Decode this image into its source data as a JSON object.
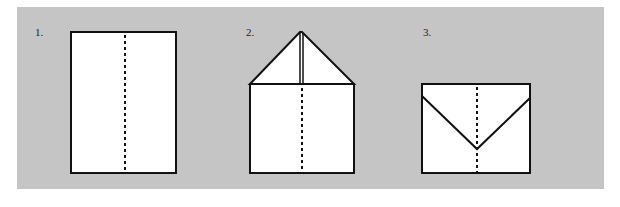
{
  "colors": {
    "panel": "#c5c5c5",
    "paper": "#ffffff",
    "line": "#111111"
  },
  "steps": [
    {
      "label": "1.",
      "description": "Rectangular sheet with vertical dotted center fold line"
    },
    {
      "label": "2.",
      "description": "Top corners folded down to the center line forming a triangle point"
    },
    {
      "label": "3.",
      "description": "Triangular top folded down forming a V shape, dotted center fold line"
    }
  ]
}
